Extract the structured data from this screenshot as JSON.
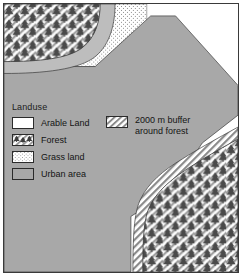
{
  "figure": {
    "kind": "landuse-map-with-buffer",
    "width": 242,
    "height": 276
  },
  "legend": {
    "title": "Landuse",
    "landuse_items": [
      {
        "label": "Arable Land",
        "swatch": "white-fill-swatch",
        "color": "#ffffff"
      },
      {
        "label": "Forest",
        "swatch": "tree-hatch-swatch",
        "color": "#555555"
      },
      {
        "label": "Grass land",
        "swatch": "stipple-dot-swatch",
        "color": "#ffffff"
      },
      {
        "label": "Urban area",
        "swatch": "solid-gray-swatch",
        "color": "#a8a8a8"
      }
    ],
    "buffer_item": {
      "label_line1": "2000 m buffer",
      "label_line2": "around forest",
      "swatch": "diagonal-hatch-swatch",
      "color": "#ffffff"
    }
  },
  "map": {
    "classes": [
      {
        "name": "Arable Land",
        "fill": "#ffffff"
      },
      {
        "name": "Grass land",
        "fill": "#f2f2f2"
      },
      {
        "name": "Urban area",
        "fill": "#a8a8a8"
      },
      {
        "name": "Forest",
        "fill": "#ffffff"
      },
      {
        "name": "2000 m buffer around forest",
        "fill": "#ffffff"
      }
    ],
    "features": [
      {
        "id": "grass-land-north",
        "class": "Grass land"
      },
      {
        "id": "arable-land-northeast",
        "class": "Arable Land"
      },
      {
        "id": "urban-area-central",
        "class": "Urban area"
      },
      {
        "id": "forest-northwest",
        "class": "Forest"
      },
      {
        "id": "buffer-northwest",
        "class": "2000 m buffer around forest"
      },
      {
        "id": "forest-southeast",
        "class": "Forest"
      },
      {
        "id": "buffer-southeast",
        "class": "2000 m buffer around forest"
      }
    ],
    "outline_color": "#2b2b2b"
  }
}
